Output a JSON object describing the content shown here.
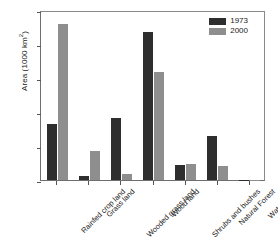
{
  "chart_data": {
    "type": "bar",
    "title": "",
    "xlabel": "",
    "ylabel": "Area (1000 km2)",
    "ylabel_text": "Area (1000 km",
    "ylabel_sup": "2",
    "ylabel_tail": ")",
    "ylim": [
      0,
      10
    ],
    "yticks": [
      0,
      2,
      4,
      6,
      8,
      10
    ],
    "ytick_labels": [
      "0",
      "2",
      "4",
      "6",
      "8",
      "10"
    ],
    "grid": false,
    "legend_position": "top-right-inside",
    "categories": [
      "Rainfed crop land",
      "Grass land",
      "Wooded grass land",
      "Wood land",
      "Shrubs and bushes",
      "Natural Forest",
      "Water body"
    ],
    "series": [
      {
        "name": "1973",
        "color": "#2e2e2e",
        "values": [
          3.3,
          0.25,
          3.65,
          8.7,
          0.9,
          2.6,
          0.02
        ]
      },
      {
        "name": "2000",
        "color": "#8e8e8e",
        "values": [
          9.2,
          1.7,
          0.35,
          6.35,
          0.95,
          0.85,
          0.03
        ]
      }
    ]
  },
  "legend": {
    "entries": [
      {
        "label": "1973"
      },
      {
        "label": "2000"
      }
    ]
  }
}
